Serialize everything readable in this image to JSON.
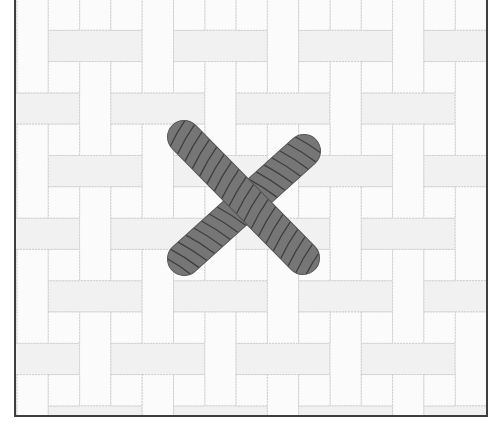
{
  "scene": {
    "label": "Crossed rope sticks on basketweave tile floor",
    "frame": {
      "border_color": "#3e3e3e",
      "background": "#ffffff"
    },
    "tiles": {
      "pattern": "basketweave-pinwheel",
      "cell_px": 31.3,
      "origin_x": 1,
      "origin_y": -1,
      "cols": 16,
      "rows": 14,
      "fill": "#fbfbfb",
      "shade": "#f1f1f1",
      "grout_color": "#cfcfcf"
    },
    "cross": {
      "fill": "#767676",
      "stripe_color": "#3f3f3f",
      "outline": "#555555",
      "width": 33,
      "bars": [
        {
          "name": "bar-backslash",
          "x1": 183,
          "y1": 136,
          "x2": 302,
          "y2": 257
        },
        {
          "name": "bar-slash",
          "x1": 303,
          "y1": 150,
          "x2": 183,
          "y2": 258
        }
      ]
    }
  }
}
